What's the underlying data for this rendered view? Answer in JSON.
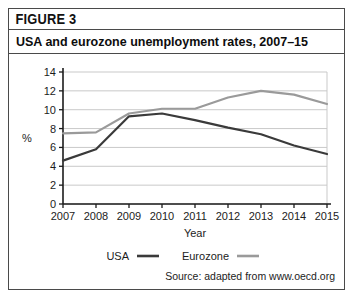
{
  "figure": {
    "label": "FIGURE 3",
    "title": "USA and eurozone unemployment rates, 2007–15",
    "source": "Source: adapted from www.oecd.org"
  },
  "colors": {
    "usa_line": "#3a3a3a",
    "eurozone_line": "#9a9a9a",
    "gridline": "#c9c9c9",
    "axis": "#1c1c1c",
    "border": "#4a4a4a",
    "background": "#ffffff"
  },
  "chart_data": {
    "type": "line",
    "title": "USA and eurozone unemployment rates, 2007–15",
    "xlabel": "Year",
    "ylabel": "%",
    "categories": [
      "2007",
      "2008",
      "2009",
      "2010",
      "2011",
      "2012",
      "2013",
      "2014",
      "2015"
    ],
    "x": [
      2007,
      2008,
      2009,
      2010,
      2011,
      2012,
      2013,
      2014,
      2015
    ],
    "xlim": [
      2007,
      2015
    ],
    "ylim": [
      0,
      14
    ],
    "yticks": [
      0,
      2,
      4,
      6,
      8,
      10,
      12,
      14
    ],
    "ytick_labels": [
      "0",
      "2",
      "4",
      "6",
      "8",
      "10",
      "12",
      "14"
    ],
    "xtick_labels": [
      "2007",
      "2008",
      "2009",
      "2010",
      "2011",
      "2012",
      "2013",
      "2014",
      "2015"
    ],
    "grid": true,
    "grid_axis": "y",
    "legend_position": "bottom",
    "series": [
      {
        "name": "USA",
        "color": "#3a3a3a",
        "values": [
          4.6,
          5.8,
          9.3,
          9.6,
          8.9,
          8.1,
          7.4,
          6.2,
          5.3
        ]
      },
      {
        "name": "Eurozone",
        "color": "#9a9a9a",
        "values": [
          7.5,
          7.6,
          9.6,
          10.1,
          10.1,
          11.3,
          12.0,
          11.6,
          10.6
        ]
      }
    ]
  },
  "legend": {
    "items": [
      {
        "label": "USA",
        "color": "#3a3a3a"
      },
      {
        "label": "Eurozone",
        "color": "#9a9a9a"
      }
    ]
  }
}
